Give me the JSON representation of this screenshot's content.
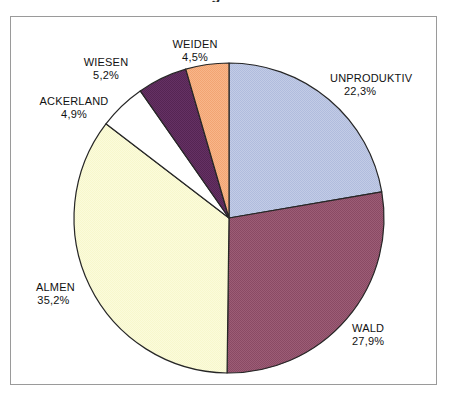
{
  "title_remnant": "Bodennutzung in der Schweiz",
  "chart_data": {
    "type": "pie",
    "title": "",
    "labels": [
      "UNPRODUKTIV",
      "WALD",
      "ALMEN",
      "ACKERLAND",
      "WIESEN",
      "WEIDEN"
    ],
    "values": [
      22.3,
      27.9,
      35.2,
      4.9,
      5.2,
      4.5
    ],
    "value_labels": [
      "22,3%",
      "27,9%",
      "35,2%",
      "4,9%",
      "5,2%",
      "4,5%"
    ],
    "colors": [
      "#bcc6e2",
      "#96566f",
      "#fafad2",
      "#ffffff",
      "#5e2c5c",
      "#f5ae7e"
    ],
    "start_angle_deg": 0,
    "direction": "clockwise",
    "legend": "none",
    "grid": false,
    "slices": [
      {
        "label": "UNPRODUKTIV",
        "value": 22.3,
        "value_label": "22,3%",
        "color": "#bcc6e2"
      },
      {
        "label": "WALD",
        "value": 27.9,
        "value_label": "27,9%",
        "color": "#96566f"
      },
      {
        "label": "ALMEN",
        "value": 35.2,
        "value_label": "35,2%",
        "color": "#fafad2"
      },
      {
        "label": "ACKERLAND",
        "value": 4.9,
        "value_label": "4,9%",
        "color": "#ffffff"
      },
      {
        "label": "WIESEN",
        "value": 5.2,
        "value_label": "5,2%",
        "color": "#5e2c5c"
      },
      {
        "label": "WEIDEN",
        "value": 4.5,
        "value_label": "4,5%",
        "color": "#f5ae7e"
      }
    ]
  },
  "labels_text": {
    "unproduktiv_name": "UNPRODUKTIV",
    "unproduktiv_value": "22,3%",
    "wald_name": "WALD",
    "wald_value": "27,9%",
    "almen_name": "ALMEN",
    "almen_value": "35,2%",
    "ackerland_name": "ACKERLAND",
    "ackerland_value": "4,9%",
    "wiesen_name": "WIESEN",
    "wiesen_value": "5,2%",
    "weiden_name": "WEIDEN",
    "weiden_value": "4,5%"
  },
  "geometry": {
    "cx": 229,
    "cy": 218,
    "r": 155,
    "outline_color": "#262626"
  }
}
